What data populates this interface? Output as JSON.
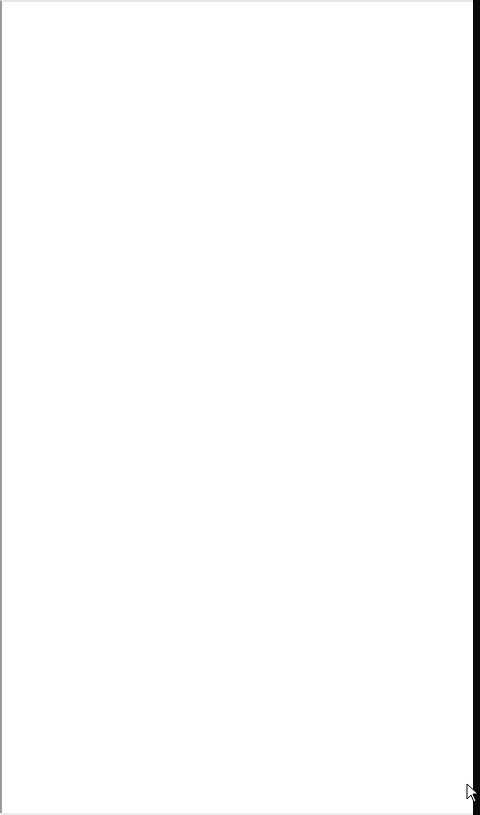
{
  "page": {
    "state": "blank",
    "background_color": "#ffffff",
    "content_text": ""
  },
  "frame": {
    "right_edge_color": "#0a0a0a",
    "left_border_color": "#9a9a9a"
  },
  "cursor": {
    "icon": "mouse-pointer-icon",
    "x": 466,
    "y": 783
  }
}
